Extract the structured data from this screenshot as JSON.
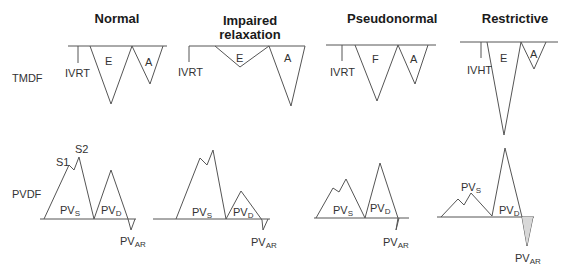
{
  "figure": {
    "columns": [
      {
        "title": "Normal"
      },
      {
        "title": "Impaired relaxation"
      },
      {
        "title": "Pseudonormal"
      },
      {
        "title": "Restrictive"
      }
    ],
    "row_labels": {
      "tmdf": "TMDF",
      "pvdf": "PVDF"
    },
    "labels": {
      "ivrt": "IVRT",
      "ivrt_restrictive": "IVHT",
      "e": "E",
      "e_pseudo": "F",
      "a": "A",
      "s1": "S1",
      "s2": "S2",
      "pv": "PV",
      "sub_s": "S",
      "sub_d": "D",
      "sub_ar": "AR"
    },
    "colors": {
      "line": "#555555",
      "baseline": "#666666",
      "text": "#333333"
    }
  }
}
